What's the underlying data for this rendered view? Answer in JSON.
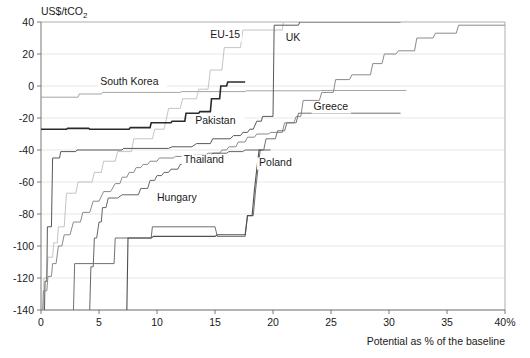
{
  "chart_data": {
    "type": "line",
    "title": "",
    "ylabel": "US$/tCO2",
    "ylabel_display": "US$/tCO",
    "ylabel_sub": "2",
    "xlabel": "Potential as % of the baseline",
    "xlim": [
      0,
      40
    ],
    "ylim": [
      -140,
      40
    ],
    "xticks": [
      "0",
      "5",
      "10",
      "15",
      "20",
      "25",
      "30",
      "35",
      "40%"
    ],
    "xtick_values": [
      0,
      5,
      10,
      15,
      20,
      25,
      30,
      35,
      40
    ],
    "yticks": [
      "40",
      "20",
      "0",
      "-20",
      "-40",
      "-60",
      "-80",
      "-100",
      "-120",
      "-140"
    ],
    "ytick_values": [
      40,
      20,
      0,
      -20,
      -40,
      -60,
      -80,
      -100,
      -120,
      -140
    ],
    "grid": true,
    "grid_axis": "y",
    "legend_position": "inline-labels",
    "series": [
      {
        "name": "South Korea",
        "color": "#9a9a9a",
        "width": 0.9,
        "label_x": 5.1,
        "label_y": 0.5,
        "points": [
          [
            0,
            -7
          ],
          [
            1.0,
            -7
          ],
          [
            3.2,
            -7
          ],
          [
            3.3,
            -5
          ],
          [
            5.2,
            -5
          ],
          [
            5.3,
            -4
          ],
          [
            12.0,
            -4
          ],
          [
            12.1,
            -3.5
          ],
          [
            17.6,
            -3.5
          ],
          [
            17.7,
            -3
          ],
          [
            24.0,
            -3
          ],
          [
            24.1,
            -2.8
          ],
          [
            31.5,
            -2.8
          ]
        ]
      },
      {
        "name": "EU-15",
        "color": "#bdbdbd",
        "width": 0.9,
        "label_x": 14.6,
        "label_y": 30,
        "points": [
          [
            0.2,
            -140
          ],
          [
            0.25,
            -120
          ],
          [
            0.5,
            -120
          ],
          [
            0.6,
            -107
          ],
          [
            1.0,
            -107
          ],
          [
            1.1,
            -98
          ],
          [
            1.4,
            -98
          ],
          [
            1.5,
            -88
          ],
          [
            2.0,
            -88
          ],
          [
            2.2,
            -67
          ],
          [
            3.0,
            -67
          ],
          [
            3.2,
            -60
          ],
          [
            4.4,
            -60
          ],
          [
            4.6,
            -54
          ],
          [
            5.2,
            -54
          ],
          [
            5.4,
            -47
          ],
          [
            6.4,
            -47
          ],
          [
            6.6,
            -41
          ],
          [
            7.8,
            -41
          ],
          [
            8.0,
            -33
          ],
          [
            9.6,
            -33
          ],
          [
            9.8,
            -27
          ],
          [
            10.6,
            -27
          ],
          [
            10.8,
            -21
          ],
          [
            11.0,
            -14
          ],
          [
            12.0,
            -14
          ],
          [
            12.2,
            -8
          ],
          [
            13.4,
            -8
          ],
          [
            13.6,
            -2
          ],
          [
            14.4,
            -2
          ],
          [
            14.6,
            10
          ],
          [
            15.6,
            10
          ],
          [
            15.8,
            24
          ],
          [
            17.2,
            24
          ],
          [
            17.4,
            35
          ],
          [
            20.8,
            35
          ],
          [
            20.9,
            40
          ]
        ]
      },
      {
        "name": "Pakistan",
        "color": "#2a2a2a",
        "width": 1.6,
        "label_x": 13.3,
        "label_y": -24,
        "points": [
          [
            0,
            -27
          ],
          [
            2.2,
            -27
          ],
          [
            2.3,
            -26.5
          ],
          [
            4.1,
            -26.5
          ],
          [
            4.2,
            -27
          ],
          [
            7.6,
            -27
          ],
          [
            7.7,
            -26
          ],
          [
            9.4,
            -26
          ],
          [
            9.5,
            -23
          ],
          [
            11.2,
            -23
          ],
          [
            11.3,
            -22
          ],
          [
            12.4,
            -22
          ],
          [
            12.5,
            -17
          ],
          [
            13.6,
            -17
          ],
          [
            13.7,
            -16
          ],
          [
            14.6,
            -16
          ],
          [
            14.7,
            -8
          ],
          [
            15.4,
            -8
          ],
          [
            15.5,
            0
          ],
          [
            16.0,
            0
          ],
          [
            16.1,
            2.5
          ],
          [
            17.6,
            2.5
          ]
        ]
      },
      {
        "name": "UK",
        "color": "#585858",
        "width": 1.0,
        "label_x": 21.1,
        "label_y": 28,
        "points": [
          [
            0.3,
            -140
          ],
          [
            0.35,
            -122
          ],
          [
            0.5,
            -122
          ],
          [
            0.55,
            -88
          ],
          [
            0.9,
            -88
          ],
          [
            1.0,
            -45
          ],
          [
            1.6,
            -45
          ],
          [
            1.7,
            -41
          ],
          [
            3.0,
            -41
          ],
          [
            3.1,
            -40
          ],
          [
            7.0,
            -40
          ],
          [
            7.1,
            -39
          ],
          [
            11.0,
            -39
          ],
          [
            11.3,
            -38
          ],
          [
            13.0,
            -38
          ],
          [
            13.4,
            -36
          ],
          [
            14.6,
            -36
          ],
          [
            14.8,
            -33
          ],
          [
            16.3,
            -33
          ],
          [
            16.6,
            -31
          ],
          [
            17.2,
            -31
          ],
          [
            17.4,
            -29
          ],
          [
            17.8,
            -29
          ],
          [
            18.0,
            -27
          ],
          [
            18.3,
            -27
          ],
          [
            18.6,
            -22
          ],
          [
            19.0,
            -22
          ],
          [
            19.1,
            -19
          ],
          [
            20.0,
            -19
          ],
          [
            20.1,
            38
          ],
          [
            22.2,
            38
          ],
          [
            22.3,
            40
          ],
          [
            31.0,
            40
          ]
        ]
      },
      {
        "name": "Greece",
        "color": "#8a8a8a",
        "width": 1.0,
        "label_x": 23.5,
        "label_y": -15,
        "points": [
          [
            0.15,
            -140
          ],
          [
            0.2,
            -128
          ],
          [
            0.5,
            -128
          ],
          [
            0.6,
            -119
          ],
          [
            0.9,
            -119
          ],
          [
            1.0,
            -111
          ],
          [
            1.3,
            -111
          ],
          [
            1.5,
            -100
          ],
          [
            1.8,
            -100
          ],
          [
            2.0,
            -93
          ],
          [
            2.5,
            -93
          ],
          [
            2.8,
            -85
          ],
          [
            3.4,
            -85
          ],
          [
            3.6,
            -79
          ],
          [
            4.2,
            -79
          ],
          [
            4.5,
            -72
          ],
          [
            5.0,
            -72
          ],
          [
            5.4,
            -66
          ],
          [
            6.0,
            -66
          ],
          [
            6.4,
            -61
          ],
          [
            6.8,
            -61
          ],
          [
            7.0,
            -57
          ],
          [
            7.4,
            -57
          ],
          [
            7.6,
            -54
          ],
          [
            8.0,
            -54
          ],
          [
            8.2,
            -51
          ],
          [
            8.6,
            -51
          ],
          [
            8.8,
            -49
          ],
          [
            9.2,
            -49
          ],
          [
            9.4,
            -47
          ],
          [
            10.0,
            -47
          ],
          [
            10.2,
            -45
          ],
          [
            11.4,
            -45
          ],
          [
            11.6,
            -44
          ],
          [
            13.0,
            -44
          ],
          [
            13.2,
            -43
          ],
          [
            14.2,
            -43
          ],
          [
            14.4,
            -42
          ],
          [
            15.4,
            -42
          ],
          [
            15.6,
            -40
          ],
          [
            16.0,
            -40
          ],
          [
            16.2,
            -38
          ],
          [
            16.8,
            -38
          ],
          [
            17.0,
            -35
          ],
          [
            17.6,
            -35
          ],
          [
            17.8,
            -32
          ],
          [
            18.4,
            -32
          ],
          [
            18.6,
            -30
          ],
          [
            19.6,
            -30
          ],
          [
            19.8,
            -29
          ],
          [
            20.8,
            -29
          ],
          [
            21.0,
            -23
          ],
          [
            21.8,
            -23
          ],
          [
            22.0,
            -19
          ],
          [
            22.4,
            -19
          ],
          [
            22.6,
            -9
          ],
          [
            24.0,
            -9
          ],
          [
            24.2,
            -4
          ],
          [
            25.2,
            -4
          ],
          [
            25.4,
            4
          ],
          [
            26.6,
            4
          ],
          [
            26.8,
            7
          ],
          [
            28.4,
            7
          ],
          [
            28.6,
            14
          ],
          [
            29.4,
            14
          ],
          [
            29.6,
            20
          ],
          [
            30.6,
            20
          ],
          [
            30.8,
            22
          ],
          [
            32.2,
            22
          ],
          [
            32.4,
            30
          ],
          [
            33.8,
            30
          ],
          [
            34.0,
            33
          ],
          [
            35.8,
            33
          ],
          [
            36.0,
            38
          ],
          [
            40,
            38
          ]
        ]
      },
      {
        "name": "Thailand",
        "color": "#707070",
        "width": 1.0,
        "label_x": 12.3,
        "label_y": -48,
        "points": [
          [
            2.8,
            -140
          ],
          [
            2.9,
            -111
          ],
          [
            6.3,
            -111
          ],
          [
            6.4,
            -95
          ],
          [
            9.5,
            -95
          ],
          [
            9.6,
            -88
          ],
          [
            15.0,
            -88
          ],
          [
            15.2,
            -94
          ],
          [
            17.6,
            -94
          ],
          [
            17.8,
            -81
          ],
          [
            18.3,
            -81
          ],
          [
            18.5,
            -65
          ],
          [
            18.7,
            -52
          ],
          [
            18.9,
            -40
          ],
          [
            19.2,
            -40
          ],
          [
            19.4,
            -33
          ],
          [
            20.2,
            -33
          ],
          [
            20.4,
            -28
          ],
          [
            21.0,
            -28
          ],
          [
            21.2,
            -23
          ],
          [
            22.0,
            -23
          ],
          [
            22.2,
            -17
          ],
          [
            31.0,
            -17
          ]
        ]
      },
      {
        "name": "Poland",
        "color": "#666666",
        "width": 1.0,
        "label_x": 18.8,
        "label_y": -50,
        "points": [
          [
            4.2,
            -140
          ],
          [
            4.3,
            -113
          ],
          [
            4.5,
            -113
          ],
          [
            4.6,
            -95
          ],
          [
            4.8,
            -95
          ],
          [
            5.0,
            -85
          ],
          [
            5.2,
            -85
          ],
          [
            5.3,
            -76
          ],
          [
            5.6,
            -76
          ],
          [
            5.8,
            -70
          ],
          [
            6.6,
            -70
          ],
          [
            7.0,
            -68
          ],
          [
            8.4,
            -68
          ],
          [
            8.6,
            -64
          ],
          [
            9.2,
            -64
          ],
          [
            9.4,
            -59
          ],
          [
            9.8,
            -59
          ],
          [
            10.0,
            -56
          ],
          [
            10.4,
            -56
          ],
          [
            10.6,
            -54
          ],
          [
            11.0,
            -54
          ],
          [
            11.2,
            -52
          ],
          [
            11.8,
            -52
          ],
          [
            12.0,
            -49
          ],
          [
            12.6,
            -49
          ],
          [
            12.8,
            -46
          ],
          [
            13.6,
            -46
          ],
          [
            13.8,
            -44
          ],
          [
            14.6,
            -44
          ],
          [
            14.8,
            -42
          ],
          [
            16.0,
            -42
          ],
          [
            16.2,
            -41
          ],
          [
            17.4,
            -41
          ],
          [
            17.6,
            -40
          ],
          [
            19.8,
            -40
          ]
        ]
      },
      {
        "name": "Hungary",
        "color": "#4f4f4f",
        "width": 1.1,
        "label_x": 10.0,
        "label_y": -72,
        "points": [
          [
            7.4,
            -140
          ],
          [
            7.5,
            -95
          ],
          [
            9.5,
            -95
          ],
          [
            9.7,
            -94
          ],
          [
            15.0,
            -94
          ],
          [
            15.2,
            -93
          ],
          [
            17.6,
            -93
          ],
          [
            17.8,
            -81
          ],
          [
            18.2,
            -81
          ],
          [
            18.4,
            -65
          ],
          [
            18.6,
            -52
          ],
          [
            18.8,
            -40
          ],
          [
            19.0,
            -40
          ]
        ]
      }
    ]
  },
  "footer": {
    "caption": ""
  }
}
